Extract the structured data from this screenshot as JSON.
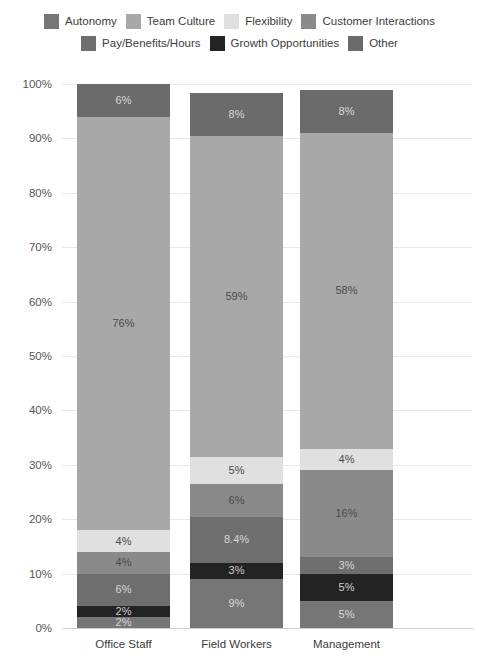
{
  "chart_data": {
    "type": "bar",
    "subtype": "stacked-bar-100",
    "title": "",
    "subtitle": "",
    "xlabel": "",
    "ylabel": "",
    "ylim": [
      0,
      100
    ],
    "y_ticks": [
      "0%",
      "10%",
      "20%",
      "30%",
      "40%",
      "50%",
      "60%",
      "70%",
      "80%",
      "90%",
      "100%"
    ],
    "y_tick_values": [
      0,
      10,
      20,
      30,
      40,
      50,
      60,
      70,
      80,
      90,
      100
    ],
    "grid": true,
    "legend_position": "top",
    "categories": [
      "Office Staff",
      "Field Workers",
      "Management"
    ],
    "series": [
      {
        "name": "Autonomy",
        "color": "#767676",
        "values": [
          2,
          9,
          5
        ],
        "labels": [
          "2%",
          "9%",
          "5%"
        ]
      },
      {
        "name": "Growth Opportunities",
        "color": "#232323",
        "values": [
          2,
          3,
          5
        ],
        "labels": [
          "2%",
          "3%",
          "5%"
        ]
      },
      {
        "name": "Pay/Benefits/Hours",
        "color": "#6e6e6e",
        "values": [
          6,
          8.4,
          3
        ],
        "labels": [
          "6%",
          "8.4%",
          "3%"
        ]
      },
      {
        "name": "Customer Interactions",
        "color": "#8a8a8a",
        "values": [
          4,
          6,
          16
        ],
        "labels": [
          "4%",
          "6%",
          "16%"
        ]
      },
      {
        "name": "Flexibility",
        "color": "#e0e0e0",
        "values": [
          4,
          5,
          4
        ],
        "labels": [
          "4%",
          "5%",
          "4%"
        ]
      },
      {
        "name": "Team Culture",
        "color": "#a8a8a8",
        "values": [
          76,
          59,
          58
        ],
        "labels": [
          "76%",
          "59%",
          "58%"
        ]
      },
      {
        "name": "Other",
        "color": "#6b6b6b",
        "values": [
          6,
          8,
          8
        ],
        "labels": [
          "6%",
          "8%",
          "8%"
        ]
      }
    ]
  },
  "legend": {
    "rows": [
      [
        {
          "label": "Autonomy",
          "color": "#767676"
        },
        {
          "label": "Team Culture",
          "color": "#a8a8a8"
        },
        {
          "label": "Flexibility",
          "color": "#e0e0e0"
        },
        {
          "label": "Customer Interactions",
          "color": "#8a8a8a"
        }
      ],
      [
        {
          "label": "Pay/Benefits/Hours",
          "color": "#6e6e6e"
        },
        {
          "label": "Growth Opportunities",
          "color": "#232323"
        },
        {
          "label": "Other",
          "color": "#6b6b6b"
        }
      ]
    ]
  }
}
